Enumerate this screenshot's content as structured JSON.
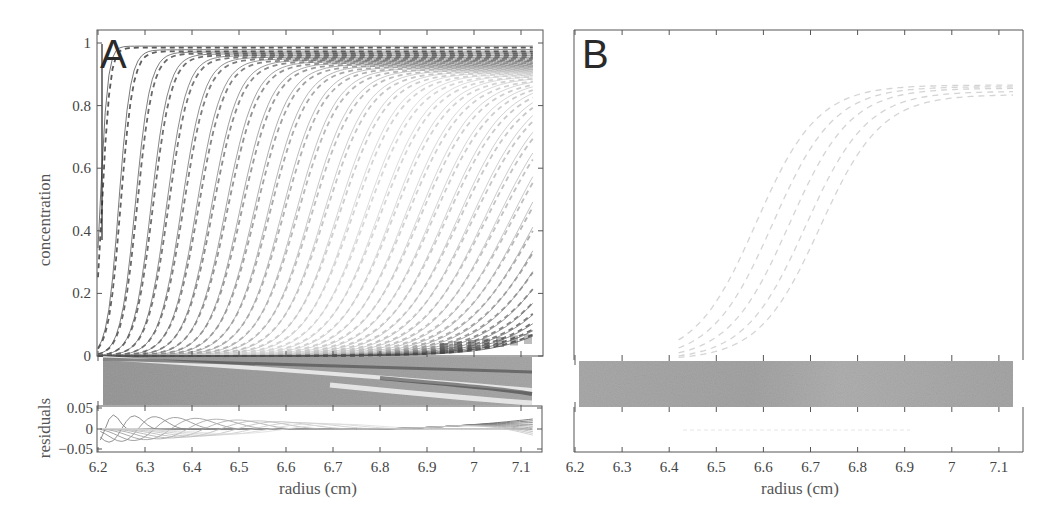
{
  "figure": {
    "panels": [
      {
        "letter": "A",
        "ylabel": "concentration",
        "residual_label": "residuals",
        "xlabel": "radius (cm)"
      },
      {
        "letter": "B",
        "xlabel": "radius (cm)"
      }
    ]
  },
  "chart_data": [
    {
      "panel": "A",
      "type": "line",
      "title": "",
      "xlabel": "radius (cm)",
      "ylabel": "concentration",
      "xlim": [
        6.2,
        7.14
      ],
      "ylim": [
        0,
        1.02
      ],
      "x_ticks": [
        "6.2",
        "6.3",
        "6.4",
        "6.5",
        "6.6",
        "6.7",
        "6.8",
        "6.9",
        "7",
        "7.1"
      ],
      "y_ticks": [
        "0",
        "0.2",
        "0.4",
        "0.6",
        "0.8",
        "1"
      ],
      "grid": false,
      "description": "Sedimentation boundary profiles: ~40 scans, data (dashed) and fit (solid), boundary midpoint moving from 6.2 to beyond 7.1 cm, plateau decreasing from ~0.99 to ~0.84; late scans pile up near base at 7.1.",
      "series_params": {
        "n_scans": 40,
        "midpoint_start": 6.205,
        "midpoint_end": 7.35,
        "plateau_start": 0.99,
        "plateau_end": 0.84,
        "width_start": 0.008,
        "width_end": 0.09
      },
      "residual_plot": {
        "ylabel": "residuals",
        "ylim": [
          -0.05,
          0.05
        ],
        "y_ticks": [
          "0.05",
          "0",
          "-0.05"
        ]
      },
      "residual_bitmap": "grayscale residual map band between main plot and residual plot"
    },
    {
      "panel": "B",
      "type": "line",
      "title": "",
      "xlabel": "radius (cm)",
      "ylabel": "",
      "xlim": [
        6.2,
        7.14
      ],
      "ylim": [
        0,
        1.02
      ],
      "x_ticks": [
        "6.2",
        "6.3",
        "6.4",
        "6.5",
        "6.6",
        "6.7",
        "6.8",
        "6.9",
        "7",
        "7.1"
      ],
      "y_ticks": [],
      "grid": false,
      "description": "Five faint dashed sigmoidal boundaries centered ~6.58-6.72 cm with plateau ~0.84-0.87; flat residuals.",
      "series_params": {
        "n_scans": 5,
        "midpoints": [
          6.585,
          6.62,
          6.655,
          6.69,
          6.72
        ],
        "plateaus": [
          0.87,
          0.865,
          0.86,
          0.85,
          0.84
        ],
        "width": 0.065
      }
    }
  ]
}
